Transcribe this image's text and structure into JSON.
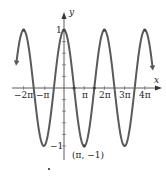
{
  "chart_data": {
    "type": "line",
    "title": "",
    "function": "y = cos x",
    "xlabel": "x",
    "ylabel": "y",
    "xlim": [
      -2.5,
      4.5
    ],
    "xlim_units": "pi",
    "ylim": [
      -1,
      1
    ],
    "grid": false,
    "legend": null,
    "x_ticks": [
      {
        "value_pi": -2,
        "label": "−2π"
      },
      {
        "value_pi": -1,
        "label": "−π"
      },
      {
        "value_pi": 1,
        "label": "π"
      },
      {
        "value_pi": 2,
        "label": "2π"
      },
      {
        "value_pi": 3,
        "label": "3π"
      },
      {
        "value_pi": 4,
        "label": "4π"
      }
    ],
    "y_ticks": [
      {
        "value": 1,
        "label": "1"
      },
      {
        "value": -1,
        "label": "−1"
      }
    ],
    "series": [
      {
        "name": "cos x",
        "x_pi": [
          -2.5,
          -2,
          -1.5,
          -1,
          -0.5,
          0,
          0.5,
          1,
          1.5,
          2,
          2.5,
          3,
          3.5,
          4,
          4.5
        ],
        "values": [
          0,
          1,
          0,
          -1,
          0,
          1,
          0,
          -1,
          0,
          1,
          0,
          -1,
          0,
          1,
          0
        ],
        "color": "#555555"
      }
    ],
    "marked_points": [
      {
        "x_pi": -2,
        "y": 1
      },
      {
        "x_pi": 0,
        "y": 1
      },
      {
        "x_pi": 0.5,
        "y": 0
      },
      {
        "x_pi": 1,
        "y": -1
      },
      {
        "x_pi": 1.5,
        "y": 0
      },
      {
        "x_pi": 2,
        "y": 1
      },
      {
        "x_pi": 4,
        "y": 1
      }
    ],
    "annotations": [
      {
        "text": "(π, −1)",
        "x_pi": 1,
        "y": -1
      }
    ]
  },
  "labels": {
    "x_axis": "x",
    "y_axis": "y",
    "y_one": "1",
    "y_neg_one": "−1",
    "tick_m2pi": "−2π",
    "tick_mpi": "−π",
    "tick_pi": "π",
    "tick_2pi": "2π",
    "tick_3pi": "3π",
    "tick_4pi": "4π",
    "point_annotation": "(π, −1)"
  }
}
